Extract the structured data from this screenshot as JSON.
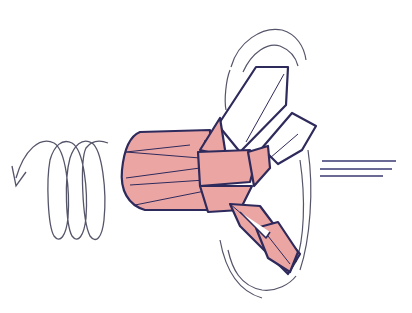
{
  "diagram": {
    "type": "origami-illustration",
    "colors": {
      "paper_color": "#eba6a4",
      "outline": "#2e2a5c",
      "motion_lines": "#55556a",
      "background": "#ffffff"
    },
    "symbols": [
      {
        "name": "spiral-rotation-arrow",
        "meaning": "twist / rotate"
      },
      {
        "name": "motion-circles",
        "meaning": "spinning blades"
      },
      {
        "name": "speed-lines",
        "meaning": "moving forward"
      }
    ]
  }
}
